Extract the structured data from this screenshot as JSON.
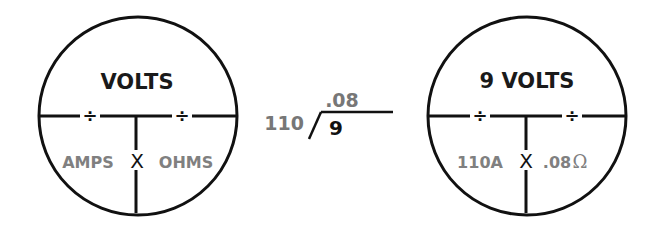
{
  "left_circle": {
    "top": "VOLTS",
    "bottom_left": "AMPS",
    "operator": "X",
    "bottom_right": "OHMS",
    "divide_symbol": "÷"
  },
  "division": {
    "quotient": ".08",
    "divisor": "110",
    "dividend": "9"
  },
  "right_circle": {
    "top": "9 VOLTS",
    "bottom_left": "110A",
    "operator": "X",
    "bottom_right": ".08",
    "unit_symbol": "Ω",
    "divide_symbol": "÷"
  }
}
